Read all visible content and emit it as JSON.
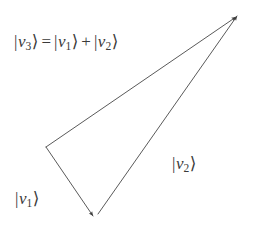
{
  "figure": {
    "type": "vector-addition-diagram",
    "background_color": "#ffffff",
    "stroke_color": "#555555",
    "text_color": "#3a3a3a",
    "width": 253,
    "height": 235
  },
  "labels": {
    "sum_equation": {
      "text": "|v3⟩ = |v1⟩ + |v2⟩",
      "lhs": {
        "bar": "|",
        "var": "v",
        "sub": "3",
        "ket": "⟩"
      },
      "equals": "=",
      "term1": {
        "bar": "|",
        "var": "v",
        "sub": "1",
        "ket": "⟩"
      },
      "plus": "+",
      "term2": {
        "bar": "|",
        "var": "v",
        "sub": "2",
        "ket": "⟩"
      }
    },
    "v1": {
      "text": "|v1⟩",
      "bar": "|",
      "var": "v",
      "sub": "1",
      "ket": "⟩"
    },
    "v2": {
      "text": "|v2⟩",
      "bar": "|",
      "var": "v",
      "sub": "2",
      "ket": "⟩"
    }
  },
  "geometry": {
    "vertices": {
      "left": {
        "x": 46,
        "y": 147
      },
      "bottom": {
        "x": 93,
        "y": 216
      },
      "apex": {
        "x": 237,
        "y": 16
      }
    },
    "vectors": [
      {
        "name": "v1",
        "from": "left",
        "to": "bottom",
        "arrowhead_at": "bottom"
      },
      {
        "name": "v2",
        "from": "bottom",
        "to": "apex",
        "arrowhead_at": "apex"
      },
      {
        "name": "v3",
        "from": "left",
        "to": "apex",
        "arrowhead_at": "apex"
      }
    ],
    "stroke_width": 1
  }
}
